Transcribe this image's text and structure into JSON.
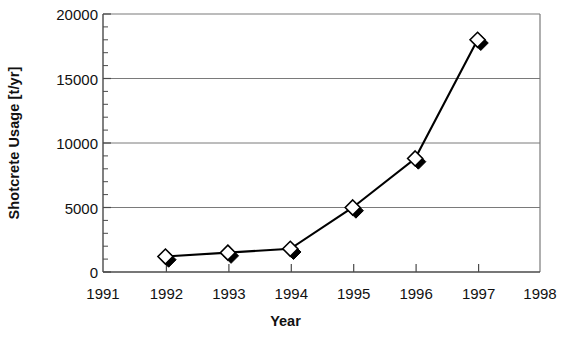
{
  "chart_data": {
    "type": "line",
    "title": "",
    "xlabel": "Year",
    "ylabel": "Shotcrete Usage [t/yr]",
    "x": [
      1992,
      1993,
      1994,
      1995,
      1996,
      1997
    ],
    "values": [
      1200,
      1500,
      1800,
      5000,
      8800,
      18000
    ],
    "series": [
      {
        "name": "Shotcrete Usage",
        "values": [
          1200,
          1500,
          1800,
          5000,
          8800,
          18000
        ]
      }
    ],
    "xlim": [
      1991,
      1998
    ],
    "ylim": [
      0,
      20000
    ],
    "xticks": [
      1991,
      1992,
      1993,
      1994,
      1995,
      1996,
      1997,
      1998
    ],
    "xtick_labels": [
      "1991",
      "1992",
      "1993",
      "1994",
      "1995",
      "1996",
      "1997",
      "1998"
    ],
    "yticks": [
      0,
      5000,
      10000,
      15000,
      20000
    ],
    "ytick_labels": [
      "0",
      "5000",
      "10000",
      "15000",
      "20000"
    ],
    "y_minor_tick_interval": 1000,
    "grid": "horizontal-major",
    "legend": "none",
    "marker": "diamond-white-with-black-shadow",
    "line_color": "#000000",
    "grid_color": "#808080",
    "axis_color": "#808080",
    "background_color": "#ffffff"
  },
  "axis": {
    "y_title": "Shotcrete Usage [t/yr]",
    "x_title": "Year"
  }
}
